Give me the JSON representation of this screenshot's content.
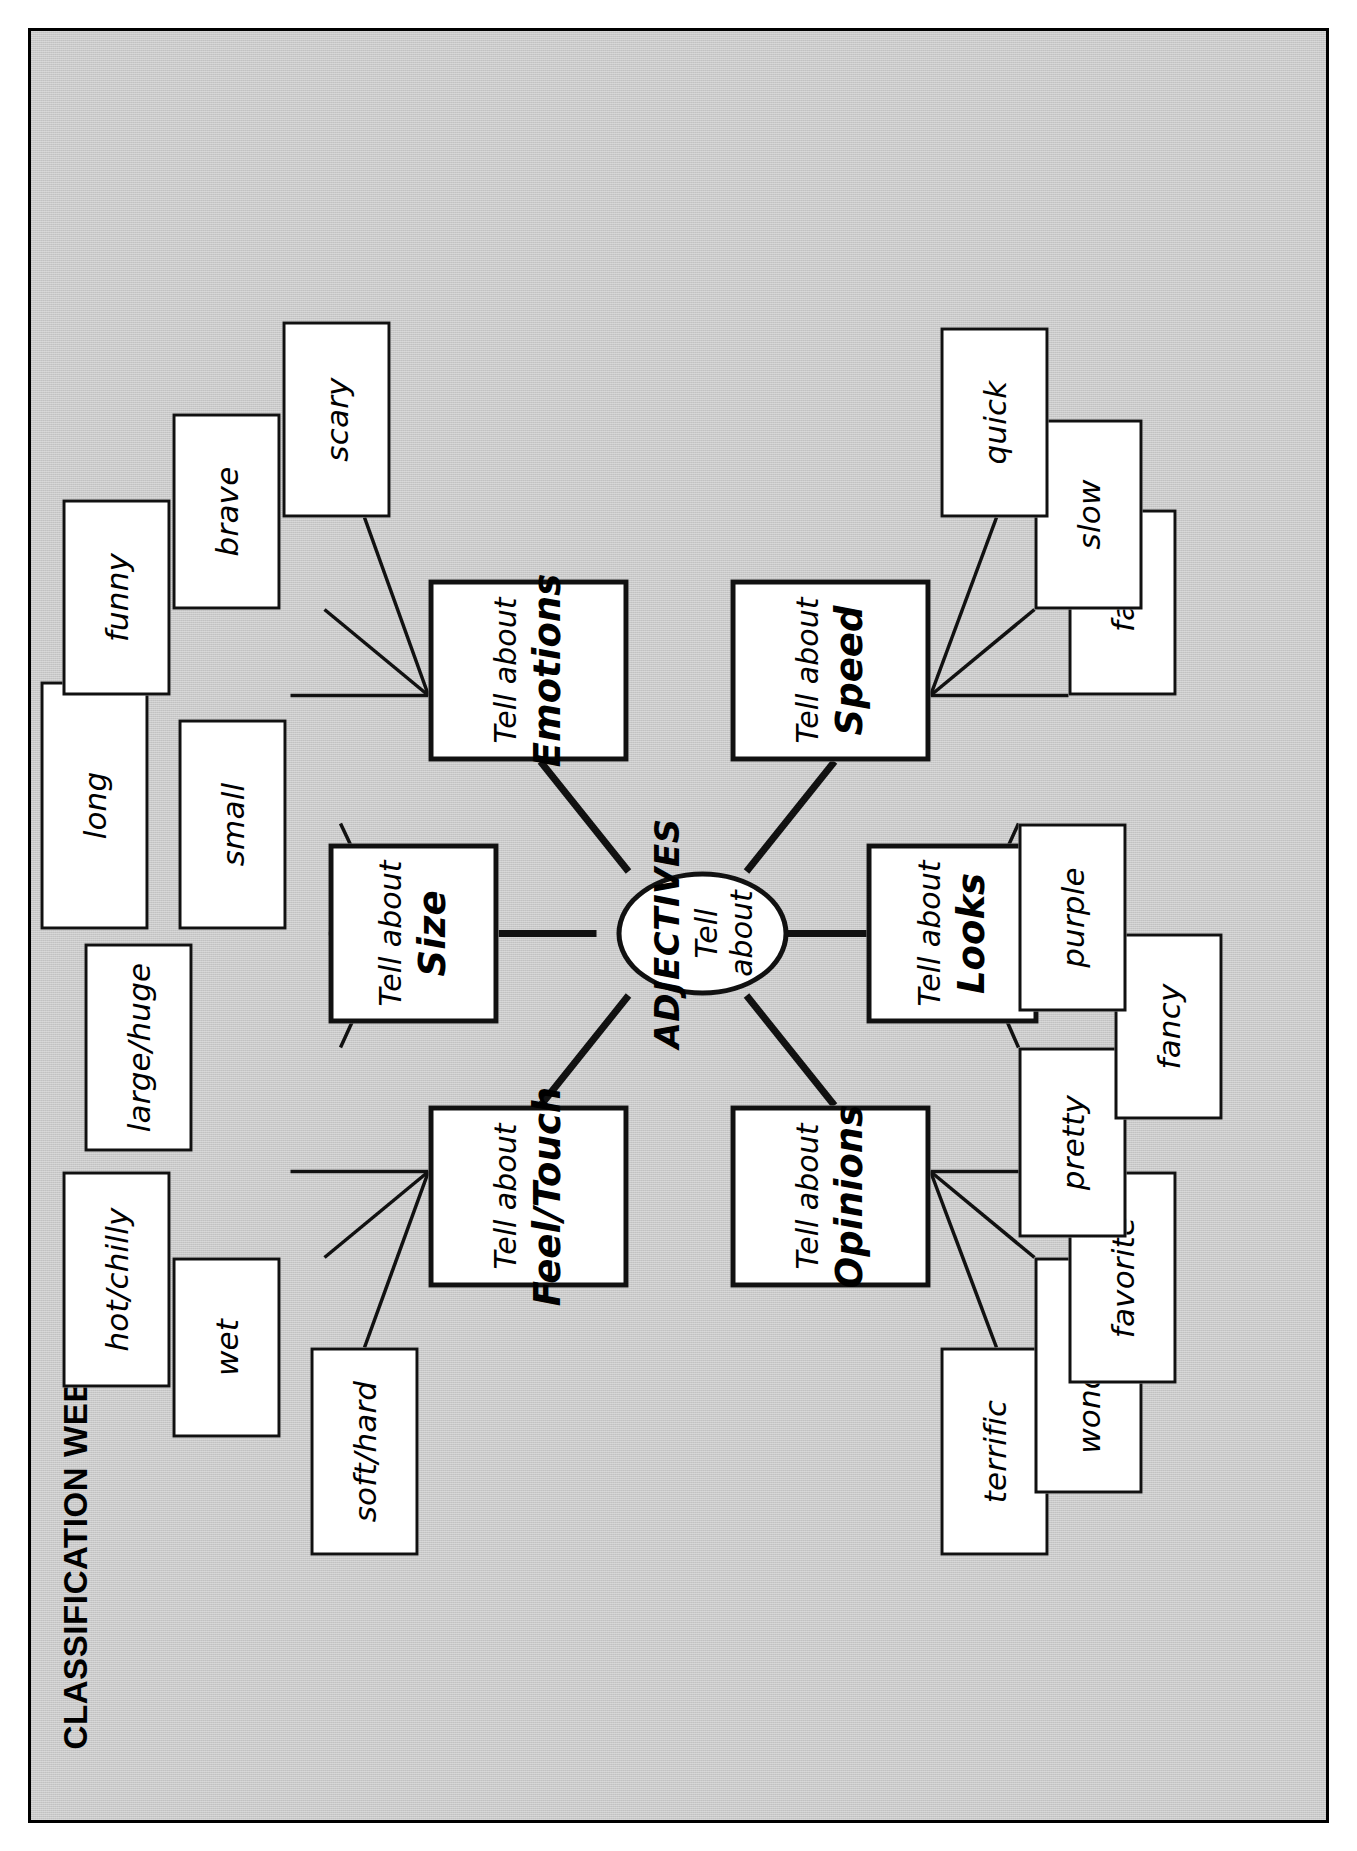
{
  "page": {
    "title": "CLASSIFICATION WEB",
    "background_color": "#c9c9c9",
    "node_fill": "#ffffff",
    "ink_color": "#111111"
  },
  "hub": {
    "line1": "ADJECTIVES",
    "line2": "Tell about"
  },
  "categories": [
    {
      "id": "size",
      "line1": "Tell about",
      "line2": "Size",
      "leaves": [
        "large/huge",
        "long",
        "small"
      ]
    },
    {
      "id": "feel-touch",
      "line1": "Tell about",
      "line2": "Feel/Touch",
      "leaves": [
        "soft/hard",
        "wet",
        "hot/chilly"
      ]
    },
    {
      "id": "emotions",
      "line1": "Tell about",
      "line2": "Emotions",
      "leaves": [
        "funny",
        "brave",
        "scary"
      ]
    },
    {
      "id": "opinions",
      "line1": "Tell about",
      "line2": "Opinions",
      "leaves": [
        "terrific",
        "wonderful",
        "favorite"
      ]
    },
    {
      "id": "looks",
      "line1": "Tell about",
      "line2": "Looks",
      "leaves": [
        "pretty",
        "fancy",
        "purple"
      ]
    },
    {
      "id": "speed",
      "line1": "Tell about",
      "line2": "Speed",
      "leaves": [
        "fast",
        "slow",
        "quick"
      ]
    }
  ]
}
